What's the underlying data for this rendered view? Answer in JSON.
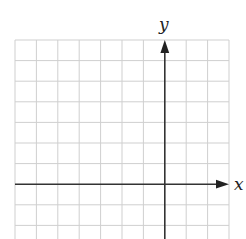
{
  "diagram": {
    "type": "coordinate-plane",
    "axes": {
      "x_label": "x",
      "y_label": "y"
    },
    "grid": {
      "columns": 10,
      "rows_visible": 9,
      "origin_column": 7,
      "origin_row": 7
    },
    "colors": {
      "grid": "#cfcfcf",
      "axis": "#333333",
      "background": "#ffffff"
    }
  }
}
